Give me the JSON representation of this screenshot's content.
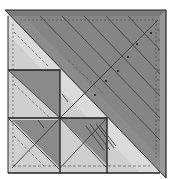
{
  "figure": {
    "colors": {
      "background": "#ffffff",
      "light_panel": "#c9c9c9",
      "lighter_panel": "#d8d8d8",
      "dark_panel": "#8a8a8a",
      "darker_band": "#7c7c7c",
      "outline": "#1e1e1e",
      "dashed": "#555555",
      "line": "#3a3a3a"
    },
    "grid": {
      "columns_x": [
        8,
        60,
        107
      ],
      "rows_y": [
        70,
        118,
        172
      ]
    }
  }
}
